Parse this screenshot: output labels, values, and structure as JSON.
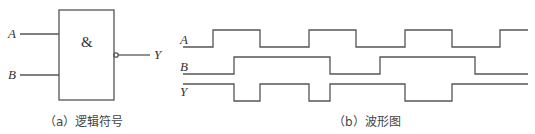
{
  "panel_a": {
    "caption": "（a）逻辑符号",
    "gate_symbol": "&",
    "inputs": [
      {
        "label": "A",
        "y": 34
      },
      {
        "label": "B",
        "y": 75
      }
    ],
    "output": {
      "label": "Y",
      "inverted": true,
      "y": 55
    },
    "gate_type": "NAND"
  },
  "panel_b": {
    "caption": "（b）波形图",
    "signals": [
      {
        "label": "A",
        "high_y": 30,
        "low_y": 47,
        "points": [
          [
            183,
            0
          ],
          [
            213,
            1
          ],
          [
            260,
            0
          ],
          [
            309,
            1
          ],
          [
            356,
            0
          ],
          [
            405,
            1
          ],
          [
            452,
            0
          ],
          [
            500,
            1
          ],
          [
            528,
            1
          ]
        ]
      },
      {
        "label": "B",
        "high_y": 57,
        "low_y": 74,
        "points": [
          [
            183,
            0
          ],
          [
            234,
            1
          ],
          [
            330,
            0
          ],
          [
            380,
            1
          ],
          [
            475,
            0
          ],
          [
            528,
            0
          ]
        ]
      },
      {
        "label": "Y",
        "high_y": 84,
        "low_y": 101,
        "points": [
          [
            183,
            1
          ],
          [
            234,
            0
          ],
          [
            260,
            1
          ],
          [
            309,
            0
          ],
          [
            330,
            1
          ],
          [
            405,
            0
          ],
          [
            452,
            1
          ],
          [
            528,
            1
          ]
        ]
      }
    ]
  },
  "colors": {
    "line": "#555555",
    "text": "#333333",
    "background": "#ffffff"
  }
}
